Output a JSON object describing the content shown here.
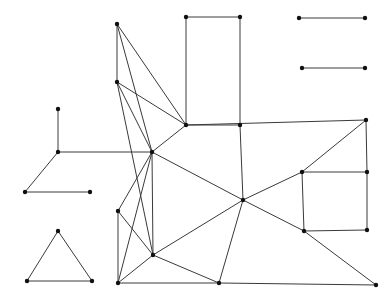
{
  "figure": {
    "width": 392,
    "height": 303,
    "background_color": "#ffffff",
    "edge_color": "#3a3a3a",
    "node_color": "#101010",
    "node_radius": 2.2,
    "edge_width": 1
  },
  "graph_data": {
    "type": "node-link-diagram",
    "directed": false,
    "node_count": 29,
    "edge_count": 48,
    "component_count": 4,
    "nodes": [
      {
        "id": "n0",
        "x": 117,
        "y": 24,
        "component": "main-mesh"
      },
      {
        "id": "n1",
        "x": 186,
        "y": 17,
        "component": "main-mesh"
      },
      {
        "id": "n2",
        "x": 240,
        "y": 17,
        "component": "main-mesh"
      },
      {
        "id": "n3",
        "x": 117,
        "y": 82,
        "component": "main-mesh"
      },
      {
        "id": "n4",
        "x": 186,
        "y": 125,
        "component": "main-mesh"
      },
      {
        "id": "n5",
        "x": 366,
        "y": 120,
        "component": "main-mesh"
      },
      {
        "id": "n6",
        "x": 58,
        "y": 109,
        "component": "left-chain"
      },
      {
        "id": "n7",
        "x": 58,
        "y": 152,
        "component": "left-chain"
      },
      {
        "id": "n8",
        "x": 25,
        "y": 192,
        "component": "left-chain"
      },
      {
        "id": "n9",
        "x": 90,
        "y": 192,
        "component": "left-chain"
      },
      {
        "id": "n10",
        "x": 152,
        "y": 152,
        "component": "main-mesh"
      },
      {
        "id": "n11",
        "x": 118,
        "y": 211,
        "component": "main-mesh"
      },
      {
        "id": "n12",
        "x": 153,
        "y": 255,
        "component": "main-mesh"
      },
      {
        "id": "n13",
        "x": 118,
        "y": 283,
        "component": "main-mesh"
      },
      {
        "id": "n14",
        "x": 219,
        "y": 283,
        "component": "main-mesh"
      },
      {
        "id": "n15",
        "x": 243,
        "y": 200,
        "component": "main-mesh"
      },
      {
        "id": "n16",
        "x": 240,
        "y": 125,
        "component": "main-mesh"
      },
      {
        "id": "n17",
        "x": 302,
        "y": 172,
        "component": "main-mesh"
      },
      {
        "id": "n18",
        "x": 367,
        "y": 172,
        "component": "main-mesh"
      },
      {
        "id": "n19",
        "x": 304,
        "y": 231,
        "component": "main-mesh"
      },
      {
        "id": "n20",
        "x": 367,
        "y": 230,
        "component": "main-mesh"
      },
      {
        "id": "n21",
        "x": 376,
        "y": 285,
        "component": "main-mesh"
      },
      {
        "id": "n22",
        "x": 299,
        "y": 18,
        "component": "isolated-edge-top"
      },
      {
        "id": "n23",
        "x": 365,
        "y": 18,
        "component": "isolated-edge-top"
      },
      {
        "id": "n24",
        "x": 302,
        "y": 68,
        "component": "isolated-edge-bottom"
      },
      {
        "id": "n25",
        "x": 365,
        "y": 68,
        "component": "isolated-edge-bottom"
      },
      {
        "id": "n26",
        "x": 58,
        "y": 231,
        "component": "triangle"
      },
      {
        "id": "n27",
        "x": 27,
        "y": 281,
        "component": "triangle"
      },
      {
        "id": "n28",
        "x": 92,
        "y": 281,
        "component": "triangle"
      }
    ],
    "edges": [
      {
        "source": "n0",
        "target": "n3"
      },
      {
        "source": "n0",
        "target": "n4"
      },
      {
        "source": "n0",
        "target": "n10"
      },
      {
        "source": "n1",
        "target": "n2"
      },
      {
        "source": "n1",
        "target": "n4"
      },
      {
        "source": "n2",
        "target": "n16"
      },
      {
        "source": "n3",
        "target": "n4"
      },
      {
        "source": "n3",
        "target": "n10"
      },
      {
        "source": "n3",
        "target": "n12"
      },
      {
        "source": "n4",
        "target": "n10"
      },
      {
        "source": "n4",
        "target": "n5"
      },
      {
        "source": "n5",
        "target": "n18"
      },
      {
        "source": "n5",
        "target": "n17"
      },
      {
        "source": "n6",
        "target": "n7"
      },
      {
        "source": "n7",
        "target": "n8"
      },
      {
        "source": "n7",
        "target": "n10"
      },
      {
        "source": "n8",
        "target": "n9"
      },
      {
        "source": "n10",
        "target": "n11"
      },
      {
        "source": "n10",
        "target": "n12"
      },
      {
        "source": "n10",
        "target": "n13"
      },
      {
        "source": "n10",
        "target": "n15"
      },
      {
        "source": "n11",
        "target": "n12"
      },
      {
        "source": "n11",
        "target": "n13"
      },
      {
        "source": "n12",
        "target": "n13"
      },
      {
        "source": "n12",
        "target": "n14"
      },
      {
        "source": "n12",
        "target": "n15"
      },
      {
        "source": "n13",
        "target": "n14"
      },
      {
        "source": "n14",
        "target": "n15"
      },
      {
        "source": "n14",
        "target": "n21"
      },
      {
        "source": "n15",
        "target": "n16"
      },
      {
        "source": "n15",
        "target": "n17"
      },
      {
        "source": "n15",
        "target": "n19"
      },
      {
        "source": "n16",
        "target": "n4"
      },
      {
        "source": "n17",
        "target": "n18"
      },
      {
        "source": "n17",
        "target": "n19"
      },
      {
        "source": "n18",
        "target": "n20"
      },
      {
        "source": "n19",
        "target": "n20"
      },
      {
        "source": "n19",
        "target": "n21"
      },
      {
        "source": "n22",
        "target": "n23"
      },
      {
        "source": "n24",
        "target": "n25"
      },
      {
        "source": "n26",
        "target": "n27"
      },
      {
        "source": "n26",
        "target": "n28"
      },
      {
        "source": "n27",
        "target": "n28"
      }
    ]
  }
}
